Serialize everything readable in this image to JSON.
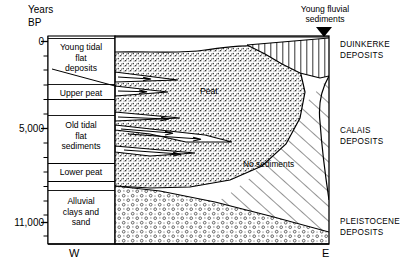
{
  "figure": {
    "type": "geological-cross-section",
    "axis": {
      "title_line1": "Years",
      "title_line2": "BP",
      "tick_labels": [
        "0",
        "5,000",
        "11,000"
      ],
      "minor_ticks": 12,
      "range_years_bp": [
        0,
        11000
      ]
    },
    "compass": {
      "west": "W",
      "east": "E"
    },
    "callout": {
      "text": "Young fluvial\nsediments",
      "arrow": "down-arrow"
    },
    "strata_column": [
      {
        "id": "young-tidal-flat-deposits",
        "label": "Young tidal\nflat\ndeposits"
      },
      {
        "id": "upper-peat",
        "label": "Upper peat"
      },
      {
        "id": "old-tidal-flat-sediments",
        "label": "Old tidal\nflat\nsediments"
      },
      {
        "id": "lower-peat",
        "label": "Lower peat"
      },
      {
        "id": "alluvial-clays-and-sand",
        "label": "Alluvial\nclays and\nsand"
      }
    ],
    "inner_labels": {
      "peat": "Peat",
      "no_sediments": "No sediments"
    },
    "deposit_groups": [
      {
        "id": "duinkerke",
        "label": "DUINKERKE\nDEPOSITS",
        "pattern": "vertical-hatch"
      },
      {
        "id": "calais",
        "label": "CALAIS\nDEPOSITS",
        "pattern": "diagonal-hatch"
      },
      {
        "id": "pleistocene",
        "label": "PLEISTOCENE\nDEPOSITS",
        "pattern": "circle-stipple"
      }
    ],
    "colors": {
      "ink": "#000000",
      "paper": "#ffffff",
      "stipple": "#4a4a4a"
    }
  }
}
